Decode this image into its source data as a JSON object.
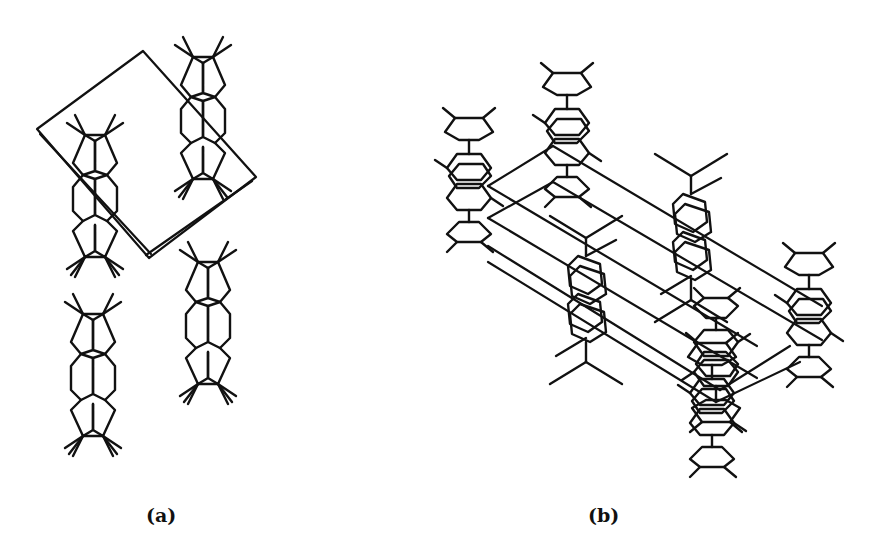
{
  "figure": {
    "panels": [
      {
        "id": "a",
        "label": "(a)",
        "description": "Crystal packing viewed along one axis with unit cell outline; five stacked tricyclic molecules"
      },
      {
        "id": "b",
        "label": "(b)",
        "description": "Perspective view of crystal packing with unit cell parallelepiped; eight molecules"
      }
    ],
    "line_color": "#111111",
    "background": "#ffffff"
  }
}
